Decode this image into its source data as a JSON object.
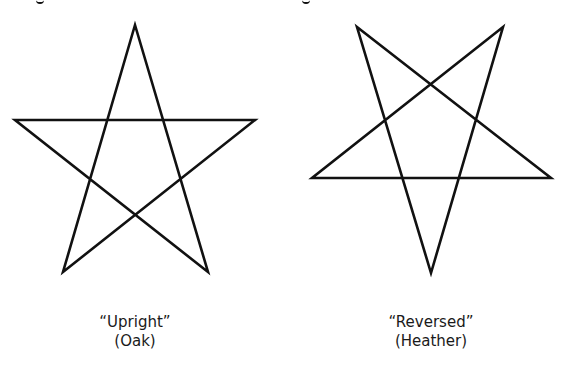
{
  "figures": [
    {
      "id": "upright",
      "title": "“Upright”",
      "subtitle": "(Oak)",
      "points": "135,25 208,272 15,120 255,120 63,272",
      "stroke": "#111111"
    },
    {
      "id": "reversed",
      "title": "“Reversed”",
      "subtitle": "(Heather)",
      "points": "357,27 551,178 312,178 503,27 431,273",
      "stroke": "#111111"
    }
  ]
}
